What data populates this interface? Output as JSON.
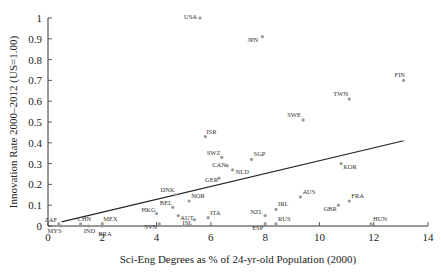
{
  "chart_data": {
    "type": "scatter",
    "title": "",
    "xlabel": "Sci-Eng Degrees as % of 24-yr-old Population (2000)",
    "ylabel": "Innovation Rate 2000–2012 (US=1.00)",
    "xlim": [
      0,
      14
    ],
    "ylim": [
      0,
      1
    ],
    "x_ticks": [
      0,
      2,
      4,
      6,
      8,
      10,
      12,
      14
    ],
    "y_ticks": [
      0,
      0.1,
      0.2,
      0.3,
      0.4,
      0.5,
      0.6,
      0.7,
      0.8,
      0.9,
      1
    ],
    "x_tick_labels": [
      "0",
      "2",
      "4",
      "6",
      "8",
      "10",
      "12",
      "14"
    ],
    "y_tick_labels": [
      "0",
      "0.1",
      "0.2",
      "0.3",
      "0.4",
      "0.5",
      "0.6",
      "0.7",
      "0.8",
      "0.9",
      "1"
    ],
    "grid": false,
    "legend": null,
    "points": [
      {
        "label": "USA",
        "x": 5.6,
        "y": 1.0,
        "lx": -16,
        "ly": 1
      },
      {
        "label": "JPN",
        "x": 7.9,
        "y": 0.91,
        "lx": -15,
        "ly": 5
      },
      {
        "label": "FIN",
        "x": 13.1,
        "y": 0.7,
        "lx": -9,
        "ly": -3
      },
      {
        "label": "TWN",
        "x": 11.1,
        "y": 0.61,
        "lx": -16,
        "ly": -3
      },
      {
        "label": "SWE",
        "x": 9.4,
        "y": 0.51,
        "lx": -16,
        "ly": -3
      },
      {
        "label": "ISR",
        "x": 5.8,
        "y": 0.43,
        "lx": 1,
        "ly": -3
      },
      {
        "label": "SWZ",
        "x": 6.4,
        "y": 0.33,
        "lx": -15,
        "ly": -2
      },
      {
        "label": "SGP",
        "x": 7.5,
        "y": 0.32,
        "lx": 2,
        "ly": -3
      },
      {
        "label": "CAN",
        "x": 6.6,
        "y": 0.29,
        "lx": -15,
        "ly": 1
      },
      {
        "label": "NLD",
        "x": 6.8,
        "y": 0.27,
        "lx": 3,
        "ly": 4
      },
      {
        "label": "GER",
        "x": 6.3,
        "y": 0.23,
        "lx": -14,
        "ly": 4
      },
      {
        "label": "KOR",
        "x": 10.8,
        "y": 0.3,
        "lx": 2,
        "ly": 5
      },
      {
        "label": "DNK",
        "x": 4.7,
        "y": 0.15,
        "lx": -15,
        "ly": -3
      },
      {
        "label": "NOR",
        "x": 5.2,
        "y": 0.12,
        "lx": 2,
        "ly": -3
      },
      {
        "label": "HKG",
        "x": 4.0,
        "y": 0.06,
        "lx": -15,
        "ly": -2
      },
      {
        "label": "BEL",
        "x": 4.6,
        "y": 0.09,
        "lx": -13,
        "ly": -2
      },
      {
        "label": "AUT",
        "x": 4.8,
        "y": 0.05,
        "lx": 2,
        "ly": 4
      },
      {
        "label": "ISL",
        "x": 5.4,
        "y": 0.03,
        "lx": -12,
        "ly": 5
      },
      {
        "label": "ITA",
        "x": 5.9,
        "y": 0.04,
        "lx": 2,
        "ly": -3
      },
      {
        "label": "SVN",
        "x": 4.1,
        "y": 0.01,
        "lx": -15,
        "ly": 5
      },
      {
        "label": "NZL",
        "x": 8.0,
        "y": 0.05,
        "lx": -15,
        "ly": -2
      },
      {
        "label": "IRL",
        "x": 8.4,
        "y": 0.08,
        "lx": 2,
        "ly": -3
      },
      {
        "label": "RUS",
        "x": 8.4,
        "y": 0.01,
        "lx": 2,
        "ly": -3
      },
      {
        "label": "ESP",
        "x": 8.0,
        "y": 0.01,
        "lx": -13,
        "ly": 6
      },
      {
        "label": "AUS",
        "x": 9.3,
        "y": 0.14,
        "lx": 2,
        "ly": -3
      },
      {
        "label": "GBR",
        "x": 10.7,
        "y": 0.1,
        "lx": -15,
        "ly": 6
      },
      {
        "label": "FRA",
        "x": 11.1,
        "y": 0.12,
        "lx": 2,
        "ly": -3
      },
      {
        "label": "HUN",
        "x": 11.9,
        "y": 0.01,
        "lx": 2,
        "ly": -3
      },
      {
        "label": "ZAF",
        "x": 0.4,
        "y": 0.01,
        "lx": -14,
        "ly": -2
      },
      {
        "label": "MYS",
        "x": 0.5,
        "y": 0.0,
        "lx": -14,
        "ly": 7
      },
      {
        "label": "CHN",
        "x": 1.2,
        "y": 0.01,
        "lx": -3,
        "ly": -3
      },
      {
        "label": "IND",
        "x": 1.5,
        "y": 0.0,
        "lx": -5,
        "ly": 7
      },
      {
        "label": "MEX",
        "x": 2.0,
        "y": 0.01,
        "lx": 1,
        "ly": -3
      },
      {
        "label": "BRA",
        "x": 2.0,
        "y": 0.0,
        "lx": -4,
        "ly": 10
      }
    ],
    "trendline": {
      "x": [
        0.5,
        13.1
      ],
      "y": [
        0.02,
        0.41
      ]
    }
  },
  "colors": {
    "axis": "#333333",
    "point": "#9a9a9a",
    "trendline": "#222222",
    "text": "#222222"
  }
}
